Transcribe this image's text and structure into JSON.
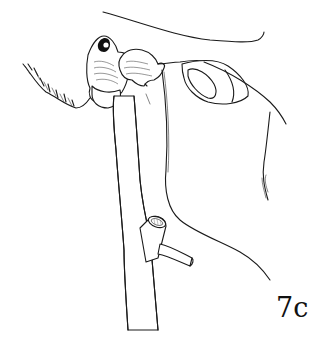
{
  "figure": {
    "label": "7c",
    "ink_color": "#1a1a1a",
    "background_color": "#ffffff"
  }
}
